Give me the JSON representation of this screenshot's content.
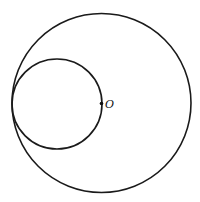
{
  "figure": {
    "colors": {
      "stroke": "#1a1a1a",
      "background": "#ffffff"
    },
    "elements": {
      "outer_circle": {
        "role": "large circle centered at O"
      },
      "inner_circle": {
        "role": "small circle tangent internally to large circle, passing through O"
      },
      "center_point": {
        "label": "O"
      }
    }
  }
}
